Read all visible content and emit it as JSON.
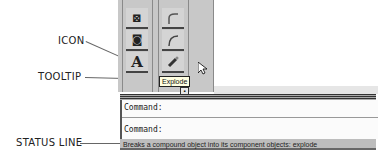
{
  "callouts": {
    "icon": "ICON",
    "tooltip": "TOOLTIP",
    "status_line": "STATUS LINE"
  },
  "toolbar": {
    "left_column": [
      {
        "icon": "region-icon",
        "glyph": "⊠"
      },
      {
        "icon": "camera-icon",
        "glyph": "◙"
      },
      {
        "icon": "text-icon",
        "glyph": "A"
      }
    ],
    "right_column": [
      {
        "icon": "fillet-icon",
        "glyph": "⌐"
      },
      {
        "icon": "arc-icon",
        "glyph": "⌒"
      },
      {
        "icon": "explode-icon",
        "glyph": "✎"
      }
    ]
  },
  "tooltip": {
    "text": "Explode"
  },
  "command_window": {
    "lines": [
      "Command:",
      "Command:"
    ]
  },
  "status_line": {
    "text": "Breaks a compound object into its component objects:  explode"
  }
}
